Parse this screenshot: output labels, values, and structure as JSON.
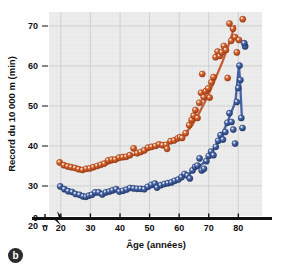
{
  "figure": {
    "panel_letter": "b",
    "background_color": "#ffffff",
    "plot_background_color": "#ebebeb",
    "gridline_color": "#c9c9c9"
  },
  "chart_data": {
    "type": "scatter",
    "title": "",
    "xlabel": "Âge (années)",
    "ylabel": "Record du 10 000 m (min)",
    "xlim": [
      16,
      88
    ],
    "ylim": [
      22.5,
      73.5
    ],
    "xticks": [
      0,
      20,
      30,
      40,
      50,
      60,
      70,
      80
    ],
    "yticks": [
      0,
      20,
      30,
      40,
      50,
      60,
      70
    ],
    "grid": true,
    "legend_position": "none",
    "axis_break": true,
    "axis_break_label": "axis-break-zigzag",
    "series": [
      {
        "name": "femmes",
        "color": "#C4552B",
        "marker": "sphere",
        "points": [
          [
            19.6,
            35.9
          ],
          [
            21.0,
            35.2
          ],
          [
            22.3,
            34.9
          ],
          [
            23.5,
            34.7
          ],
          [
            24.8,
            34.5
          ],
          [
            26.0,
            34.2
          ],
          [
            27.3,
            34.0
          ],
          [
            28.6,
            34.3
          ],
          [
            29.8,
            34.4
          ],
          [
            31.0,
            34.7
          ],
          [
            32.3,
            35.0
          ],
          [
            33.5,
            35.3
          ],
          [
            34.7,
            35.6
          ],
          [
            36.0,
            36.4
          ],
          [
            37.2,
            36.6
          ],
          [
            38.4,
            36.6
          ],
          [
            39.7,
            37.1
          ],
          [
            40.9,
            37.2
          ],
          [
            42.1,
            37.3
          ],
          [
            43.3,
            37.7
          ],
          [
            44.6,
            39.4
          ],
          [
            45.8,
            38.2
          ],
          [
            47.0,
            38.5
          ],
          [
            48.2,
            38.9
          ],
          [
            49.5,
            39.6
          ],
          [
            50.7,
            39.8
          ],
          [
            52.0,
            40.0
          ],
          [
            53.2,
            40.4
          ],
          [
            54.4,
            40.2
          ],
          [
            55.6,
            40.3
          ],
          [
            55.9,
            39.3
          ],
          [
            57.1,
            41.2
          ],
          [
            58.3,
            41.4
          ],
          [
            59.5,
            41.9
          ],
          [
            60.3,
            42.2
          ],
          [
            61.0,
            42.0
          ],
          [
            62.2,
            43.2
          ],
          [
            63.4,
            45.2
          ],
          [
            64.2,
            46.5
          ],
          [
            64.9,
            47.6
          ],
          [
            65.5,
            49.0
          ],
          [
            66.2,
            47.0
          ],
          [
            66.8,
            50.8
          ],
          [
            67.4,
            53.3
          ],
          [
            67.8,
            58.0
          ],
          [
            68.3,
            52.2
          ],
          [
            69.0,
            53.7
          ],
          [
            69.8,
            54.4
          ],
          [
            70.3,
            52.1
          ],
          [
            70.9,
            55.9
          ],
          [
            71.6,
            57.2
          ],
          [
            72.3,
            62.2
          ],
          [
            73.0,
            63.6
          ],
          [
            73.7,
            62.5
          ],
          [
            74.4,
            63.4
          ],
          [
            75.1,
            65.0
          ],
          [
            75.8,
            64.0
          ],
          [
            76.4,
            57.0
          ],
          [
            77.0,
            70.6
          ],
          [
            77.6,
            66.3
          ],
          [
            78.2,
            69.3
          ],
          [
            78.9,
            67.2
          ],
          [
            79.5,
            63.4
          ],
          [
            80.2,
            66.5
          ],
          [
            81.5,
            71.7
          ]
        ],
        "fit_line": [
          [
            19.6,
            35.9
          ],
          [
            24.0,
            34.8
          ],
          [
            28.0,
            34.3
          ],
          [
            32.0,
            34.7
          ],
          [
            36.0,
            35.6
          ],
          [
            40.0,
            36.6
          ],
          [
            44.0,
            37.6
          ],
          [
            48.0,
            38.6
          ],
          [
            52.0,
            39.7
          ],
          [
            56.0,
            40.8
          ],
          [
            59.0,
            41.6
          ],
          [
            62.0,
            43.0
          ],
          [
            64.5,
            45.3
          ],
          [
            67.0,
            48.6
          ],
          [
            69.5,
            52.2
          ],
          [
            72.0,
            56.4
          ],
          [
            74.5,
            60.8
          ],
          [
            76.5,
            64.8
          ],
          [
            78.0,
            68.2
          ],
          [
            78.8,
            70.0
          ]
        ]
      },
      {
        "name": "hommes",
        "color": "#3C5B9E",
        "marker": "sphere",
        "points": [
          [
            19.8,
            29.9
          ],
          [
            21.2,
            29.2
          ],
          [
            22.5,
            28.7
          ],
          [
            23.8,
            28.5
          ],
          [
            25.0,
            28.0
          ],
          [
            26.3,
            27.8
          ],
          [
            27.5,
            27.4
          ],
          [
            28.5,
            27.3
          ],
          [
            29.5,
            27.6
          ],
          [
            30.5,
            27.8
          ],
          [
            31.6,
            28.4
          ],
          [
            32.8,
            28.4
          ],
          [
            34.0,
            27.9
          ],
          [
            35.2,
            28.4
          ],
          [
            36.4,
            28.6
          ],
          [
            37.5,
            28.9
          ],
          [
            38.7,
            29.2
          ],
          [
            39.8,
            28.6
          ],
          [
            41.0,
            28.8
          ],
          [
            42.2,
            29.1
          ],
          [
            43.4,
            29.5
          ],
          [
            44.6,
            29.4
          ],
          [
            45.8,
            29.3
          ],
          [
            47.0,
            29.3
          ],
          [
            48.2,
            29.2
          ],
          [
            49.4,
            29.8
          ],
          [
            50.6,
            30.3
          ],
          [
            51.8,
            30.6
          ],
          [
            52.5,
            29.6
          ],
          [
            53.8,
            30.2
          ],
          [
            55.0,
            30.5
          ],
          [
            56.2,
            30.7
          ],
          [
            57.4,
            30.9
          ],
          [
            58.5,
            31.3
          ],
          [
            59.7,
            31.6
          ],
          [
            60.8,
            32.2
          ],
          [
            61.8,
            33.0
          ],
          [
            62.8,
            32.6
          ],
          [
            63.6,
            31.9
          ],
          [
            64.5,
            33.9
          ],
          [
            65.4,
            34.8
          ],
          [
            66.2,
            35.1
          ],
          [
            66.9,
            36.9
          ],
          [
            67.6,
            33.9
          ],
          [
            68.4,
            34.3
          ],
          [
            69.2,
            36.2
          ],
          [
            70.0,
            37.5
          ],
          [
            70.8,
            38.6
          ],
          [
            71.6,
            37.7
          ],
          [
            72.4,
            39.8
          ],
          [
            73.2,
            41.3
          ],
          [
            74.0,
            42.7
          ],
          [
            74.8,
            41.6
          ],
          [
            75.6,
            43.5
          ],
          [
            76.3,
            45.8
          ],
          [
            77.0,
            48.2
          ],
          [
            77.7,
            46.0
          ],
          [
            78.3,
            44.1
          ],
          [
            78.9,
            40.6
          ],
          [
            79.5,
            51.0
          ],
          [
            80.0,
            54.5
          ],
          [
            80.4,
            60.1
          ],
          [
            80.7,
            56.5
          ],
          [
            81.0,
            47.0
          ],
          [
            81.4,
            44.5
          ],
          [
            82.3,
            64.9
          ],
          [
            82.0,
            65.7
          ]
        ],
        "fit_line": [
          [
            19.8,
            29.9
          ],
          [
            23.0,
            28.6
          ],
          [
            26.0,
            27.9
          ],
          [
            29.0,
            27.5
          ],
          [
            33.0,
            28.1
          ],
          [
            37.0,
            28.6
          ],
          [
            41.0,
            28.9
          ],
          [
            45.0,
            29.2
          ],
          [
            49.0,
            29.5
          ],
          [
            53.0,
            30.1
          ],
          [
            57.0,
            30.8
          ],
          [
            60.0,
            31.7
          ],
          [
            63.0,
            32.8
          ],
          [
            65.5,
            34.3
          ],
          [
            68.0,
            35.6
          ],
          [
            70.0,
            37.4
          ],
          [
            72.0,
            39.6
          ],
          [
            74.0,
            42.3
          ],
          [
            76.0,
            45.4
          ],
          [
            77.5,
            48.2
          ],
          [
            79.0,
            51.0
          ],
          [
            80.2,
            60.2
          ],
          [
            80.6,
            56.0
          ],
          [
            81.2,
            47.2
          ]
        ]
      }
    ]
  }
}
